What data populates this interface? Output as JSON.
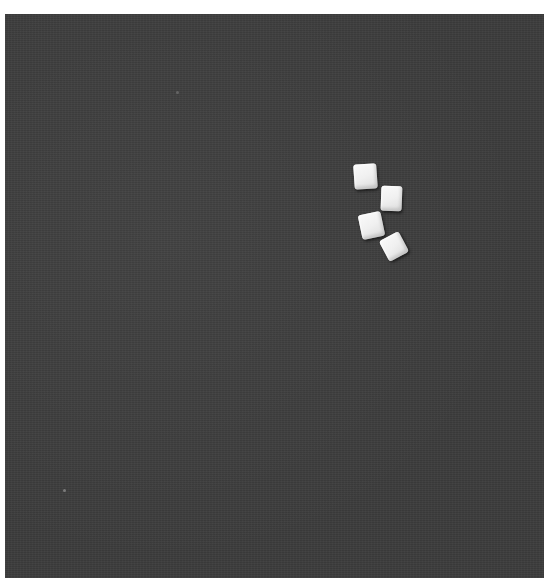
{
  "scene": {
    "description": "Four white sugar-cube-like blocks on a dark grey textured surface",
    "background_color": "#3c3c3c",
    "border_color": "#ffffff",
    "objects": [
      {
        "name": "cube-1",
        "color": "#f2f2f2"
      },
      {
        "name": "cube-2",
        "color": "#f2f2f2"
      },
      {
        "name": "cube-3",
        "color": "#f2f2f2"
      },
      {
        "name": "cube-4",
        "color": "#f2f2f2"
      }
    ]
  }
}
